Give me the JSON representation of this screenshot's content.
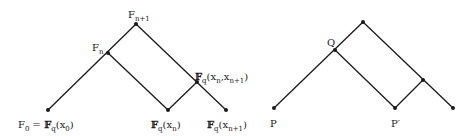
{
  "left_diagram": {
    "labels": {
      "f_n1": {
        "base": "F",
        "sub": "n+1"
      },
      "f_n": {
        "base": "F",
        "sub": "n"
      },
      "junction": {
        "base": "𝔽",
        "sub": "q",
        "args": "(x",
        "argsub1": "n",
        "mid": ",x",
        "argsub2": "n+1",
        "close": ")"
      },
      "f0": {
        "base": "F",
        "sub": "0",
        "eq": " = ",
        "bb": "𝔽",
        "bbsub": "q",
        "arg": "(x",
        "argsub": "0",
        "close": ")"
      },
      "bottom_mid": {
        "bb": "𝔽",
        "bbsub": "q",
        "arg": "(x",
        "argsub": "n",
        "close": ")"
      },
      "bottom_right": {
        "bb": "𝔽",
        "bbsub": "q",
        "arg": "(x",
        "argsub": "n+1",
        "close": ")"
      }
    },
    "points": {
      "bottom_left": [
        48,
        110
      ],
      "f_n": [
        108,
        53
      ],
      "apex": [
        136,
        24
      ],
      "bottom_mid": [
        168,
        110
      ],
      "junction": [
        197,
        82
      ],
      "bottom_right": [
        226,
        110
      ]
    }
  },
  "right_diagram": {
    "labels": {
      "p": "P",
      "q": "Q",
      "p_prime": "P′"
    },
    "points": {
      "p": [
        274,
        108
      ],
      "q": [
        335,
        50
      ],
      "apex": [
        363,
        22
      ],
      "p_prime": [
        395,
        108
      ],
      "junction": [
        423,
        80
      ],
      "bottom_right": [
        453,
        108
      ]
    }
  },
  "colors": {
    "line": "#1a1a1a",
    "text": "#1a1a1a"
  }
}
